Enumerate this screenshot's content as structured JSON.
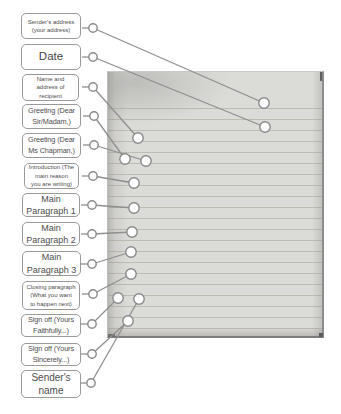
{
  "labels": [
    {
      "id": "sender-address",
      "text": "Sender's address\n(your address)"
    },
    {
      "id": "date",
      "text": "Date"
    },
    {
      "id": "recipient-address",
      "text": "Name and\naddress of\nrecipient"
    },
    {
      "id": "greeting-sir-madam",
      "text": "Greeting (Dear\nSir/Madam,)"
    },
    {
      "id": "greeting-ms-chapman",
      "text": "Greeting (Dear\nMs Chapman,)"
    },
    {
      "id": "introduction",
      "text": "Introduction (The\nmain reason\nyou are writing)"
    },
    {
      "id": "main-paragraph-1",
      "text": "Main\nParagraph 1"
    },
    {
      "id": "main-paragraph-2",
      "text": "Main\nParagraph 2"
    },
    {
      "id": "main-paragraph-3",
      "text": "Main\nParagraph 3"
    },
    {
      "id": "closing-paragraph",
      "text": "Closing paragraph\n(What you want\nto happen next)"
    },
    {
      "id": "sign-off-faithfully",
      "text": "Sign off (Yours\nFaithfully...)"
    },
    {
      "id": "sign-off-sincerely",
      "text": "Sign off (Yours\nSincerely...)"
    },
    {
      "id": "sender-name",
      "text": "Sender's\nname"
    }
  ],
  "colors": {
    "connector": "#8f8f8f",
    "circle_stroke": "#898989",
    "circle_fill": "#ffffff",
    "box_border": "#9a9a9a",
    "box_text": "#4d4d4d",
    "paper_fill": "#dbdbd8",
    "paper_rule_line": "#b4a98f"
  },
  "diagram": {
    "connectors": [
      {
        "label": "sender-address",
        "from": [
          93,
          28
        ],
        "to": [
          264,
          103
        ]
      },
      {
        "label": "date",
        "from": [
          93,
          57
        ],
        "to": [
          265,
          127
        ]
      },
      {
        "label": "recipient-address",
        "from": [
          93,
          87
        ],
        "to": [
          138,
          138
        ]
      },
      {
        "label": "greeting-sir-madam",
        "from": [
          94,
          116
        ],
        "to": [
          125,
          159
        ]
      },
      {
        "label": "greeting-ms-chapman",
        "from": [
          94,
          145
        ],
        "to": [
          146,
          161
        ]
      },
      {
        "label": "introduction",
        "from": [
          93,
          176
        ],
        "to": [
          134,
          183
        ]
      },
      {
        "label": "main-paragraph-1",
        "from": [
          92,
          205
        ],
        "to": [
          134,
          208
        ]
      },
      {
        "label": "main-paragraph-2",
        "from": [
          92,
          234
        ],
        "to": [
          132,
          232
        ]
      },
      {
        "label": "main-paragraph-3",
        "from": [
          92,
          264
        ],
        "to": [
          131,
          252
        ]
      },
      {
        "label": "closing-paragraph",
        "from": [
          93,
          294
        ],
        "to": [
          131,
          274
        ]
      },
      {
        "label": "sign-off-faithfully",
        "from": [
          92,
          324
        ],
        "to": [
          118,
          298
        ]
      },
      {
        "label": "sign-off-sincerely",
        "from": [
          92,
          354
        ],
        "to": [
          128,
          321
        ]
      },
      {
        "label": "sender-name",
        "from": [
          91,
          383
        ],
        "to": [
          139,
          299
        ]
      }
    ]
  }
}
